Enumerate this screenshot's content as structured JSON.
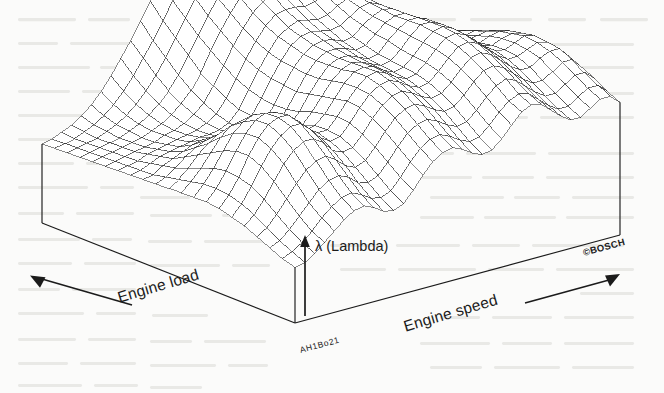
{
  "figure": {
    "kind": "3d-wireframe-surface",
    "source_mark": "©BOSCH",
    "figure_code": "AH1Bo21",
    "background_color": "#fbfbfa",
    "ink_color": "#1b1b1b",
    "mesh_color": "#2a2a2a"
  },
  "labels": {
    "vertical_axis": "λ (Lambda)",
    "left_axis": "Engine load",
    "right_axis": "Engine speed",
    "bosch": "©BOSCH",
    "code": "AH1Bo21"
  },
  "icons": {
    "up_arrow": "lambda-up-arrow-icon",
    "left_arrow": "engine-load-left-arrow-icon",
    "right_arrow": "engine-speed-right-arrow-icon"
  },
  "chart_data": {
    "type": "surface",
    "title": "",
    "xlabel": "Engine speed",
    "ylabel": "Engine load",
    "zlabel": "λ (Lambda)",
    "grid": false,
    "legend": "none",
    "axis_direction": {
      "engine_speed": "increasing to the right",
      "engine_load": "increasing to the left",
      "lambda": "increasing upward"
    },
    "nx": 34,
    "ny": 22,
    "zlim": [
      0,
      1
    ],
    "z": [
      [
        0.26,
        0.27,
        0.3,
        0.34,
        0.38,
        0.42,
        0.45,
        0.46,
        0.44,
        0.41,
        0.4,
        0.42,
        0.47,
        0.53,
        0.58,
        0.61,
        0.62,
        0.6,
        0.57,
        0.55,
        0.56,
        0.6,
        0.65,
        0.7,
        0.72,
        0.71,
        0.67,
        0.63,
        0.6,
        0.6,
        0.63,
        0.66,
        0.66,
        0.62
      ],
      [
        0.27,
        0.29,
        0.32,
        0.36,
        0.41,
        0.45,
        0.48,
        0.49,
        0.47,
        0.44,
        0.43,
        0.45,
        0.5,
        0.56,
        0.61,
        0.64,
        0.65,
        0.63,
        0.6,
        0.58,
        0.59,
        0.63,
        0.68,
        0.72,
        0.74,
        0.73,
        0.69,
        0.65,
        0.62,
        0.62,
        0.65,
        0.68,
        0.68,
        0.64
      ],
      [
        0.29,
        0.31,
        0.35,
        0.4,
        0.45,
        0.5,
        0.53,
        0.54,
        0.52,
        0.48,
        0.47,
        0.49,
        0.54,
        0.6,
        0.65,
        0.68,
        0.69,
        0.67,
        0.64,
        0.62,
        0.63,
        0.67,
        0.72,
        0.76,
        0.78,
        0.76,
        0.72,
        0.68,
        0.65,
        0.65,
        0.68,
        0.71,
        0.71,
        0.67
      ],
      [
        0.31,
        0.34,
        0.39,
        0.45,
        0.51,
        0.56,
        0.59,
        0.6,
        0.57,
        0.53,
        0.51,
        0.53,
        0.58,
        0.64,
        0.69,
        0.72,
        0.73,
        0.71,
        0.68,
        0.66,
        0.67,
        0.71,
        0.76,
        0.8,
        0.81,
        0.79,
        0.75,
        0.71,
        0.68,
        0.68,
        0.71,
        0.74,
        0.74,
        0.69
      ],
      [
        0.33,
        0.37,
        0.43,
        0.5,
        0.57,
        0.62,
        0.65,
        0.65,
        0.62,
        0.57,
        0.55,
        0.56,
        0.61,
        0.67,
        0.72,
        0.75,
        0.76,
        0.74,
        0.71,
        0.69,
        0.7,
        0.74,
        0.79,
        0.83,
        0.84,
        0.82,
        0.78,
        0.74,
        0.71,
        0.71,
        0.74,
        0.76,
        0.76,
        0.71
      ],
      [
        0.34,
        0.39,
        0.46,
        0.54,
        0.61,
        0.66,
        0.69,
        0.69,
        0.65,
        0.6,
        0.57,
        0.58,
        0.63,
        0.69,
        0.74,
        0.77,
        0.78,
        0.76,
        0.73,
        0.71,
        0.72,
        0.76,
        0.81,
        0.85,
        0.86,
        0.84,
        0.8,
        0.76,
        0.73,
        0.73,
        0.75,
        0.77,
        0.76,
        0.71
      ],
      [
        0.35,
        0.4,
        0.47,
        0.56,
        0.63,
        0.68,
        0.7,
        0.7,
        0.66,
        0.61,
        0.58,
        0.58,
        0.63,
        0.69,
        0.74,
        0.78,
        0.79,
        0.77,
        0.74,
        0.72,
        0.73,
        0.77,
        0.82,
        0.86,
        0.87,
        0.85,
        0.81,
        0.77,
        0.74,
        0.73,
        0.75,
        0.77,
        0.76,
        0.7
      ],
      [
        0.35,
        0.4,
        0.47,
        0.55,
        0.62,
        0.67,
        0.69,
        0.68,
        0.64,
        0.59,
        0.56,
        0.57,
        0.61,
        0.67,
        0.73,
        0.77,
        0.78,
        0.77,
        0.74,
        0.72,
        0.73,
        0.77,
        0.82,
        0.86,
        0.87,
        0.85,
        0.81,
        0.77,
        0.73,
        0.72,
        0.74,
        0.75,
        0.74,
        0.68
      ],
      [
        0.34,
        0.39,
        0.45,
        0.52,
        0.59,
        0.63,
        0.65,
        0.64,
        0.6,
        0.55,
        0.53,
        0.54,
        0.59,
        0.65,
        0.71,
        0.75,
        0.77,
        0.76,
        0.74,
        0.72,
        0.73,
        0.77,
        0.82,
        0.86,
        0.86,
        0.84,
        0.8,
        0.75,
        0.71,
        0.7,
        0.72,
        0.73,
        0.72,
        0.66
      ],
      [
        0.33,
        0.37,
        0.42,
        0.48,
        0.54,
        0.58,
        0.59,
        0.58,
        0.55,
        0.51,
        0.49,
        0.51,
        0.56,
        0.63,
        0.69,
        0.74,
        0.76,
        0.76,
        0.74,
        0.72,
        0.73,
        0.78,
        0.82,
        0.85,
        0.85,
        0.83,
        0.78,
        0.73,
        0.69,
        0.68,
        0.69,
        0.7,
        0.69,
        0.63
      ],
      [
        0.32,
        0.35,
        0.39,
        0.44,
        0.48,
        0.51,
        0.52,
        0.51,
        0.49,
        0.46,
        0.45,
        0.48,
        0.54,
        0.61,
        0.68,
        0.73,
        0.76,
        0.76,
        0.75,
        0.73,
        0.74,
        0.78,
        0.82,
        0.84,
        0.84,
        0.81,
        0.76,
        0.71,
        0.67,
        0.65,
        0.66,
        0.67,
        0.66,
        0.6
      ],
      [
        0.31,
        0.33,
        0.36,
        0.4,
        0.43,
        0.45,
        0.46,
        0.45,
        0.44,
        0.42,
        0.43,
        0.46,
        0.53,
        0.61,
        0.68,
        0.73,
        0.76,
        0.77,
        0.76,
        0.74,
        0.75,
        0.79,
        0.82,
        0.84,
        0.83,
        0.79,
        0.74,
        0.69,
        0.64,
        0.62,
        0.63,
        0.64,
        0.63,
        0.57
      ],
      [
        0.3,
        0.31,
        0.34,
        0.36,
        0.38,
        0.4,
        0.41,
        0.41,
        0.4,
        0.4,
        0.41,
        0.46,
        0.53,
        0.61,
        0.68,
        0.74,
        0.77,
        0.78,
        0.77,
        0.76,
        0.77,
        0.8,
        0.83,
        0.84,
        0.82,
        0.78,
        0.72,
        0.66,
        0.62,
        0.6,
        0.6,
        0.61,
        0.6,
        0.54
      ],
      [
        0.29,
        0.3,
        0.32,
        0.34,
        0.35,
        0.36,
        0.37,
        0.38,
        0.38,
        0.39,
        0.41,
        0.46,
        0.54,
        0.62,
        0.69,
        0.75,
        0.78,
        0.8,
        0.79,
        0.78,
        0.79,
        0.82,
        0.84,
        0.84,
        0.82,
        0.77,
        0.71,
        0.65,
        0.6,
        0.58,
        0.58,
        0.58,
        0.57,
        0.51
      ],
      [
        0.28,
        0.29,
        0.3,
        0.32,
        0.33,
        0.34,
        0.35,
        0.36,
        0.37,
        0.39,
        0.42,
        0.48,
        0.56,
        0.64,
        0.71,
        0.77,
        0.81,
        0.82,
        0.82,
        0.81,
        0.82,
        0.84,
        0.85,
        0.85,
        0.82,
        0.77,
        0.7,
        0.64,
        0.59,
        0.56,
        0.55,
        0.55,
        0.54,
        0.48
      ],
      [
        0.27,
        0.28,
        0.29,
        0.3,
        0.31,
        0.32,
        0.34,
        0.35,
        0.37,
        0.4,
        0.44,
        0.51,
        0.59,
        0.67,
        0.74,
        0.8,
        0.84,
        0.86,
        0.85,
        0.84,
        0.85,
        0.86,
        0.87,
        0.86,
        0.83,
        0.77,
        0.7,
        0.63,
        0.57,
        0.54,
        0.53,
        0.52,
        0.51,
        0.45
      ],
      [
        0.26,
        0.27,
        0.28,
        0.29,
        0.3,
        0.31,
        0.33,
        0.35,
        0.38,
        0.42,
        0.47,
        0.54,
        0.63,
        0.71,
        0.78,
        0.84,
        0.88,
        0.89,
        0.88,
        0.87,
        0.87,
        0.88,
        0.88,
        0.87,
        0.83,
        0.77,
        0.69,
        0.62,
        0.56,
        0.52,
        0.5,
        0.49,
        0.48,
        0.42
      ],
      [
        0.25,
        0.26,
        0.27,
        0.28,
        0.29,
        0.31,
        0.33,
        0.36,
        0.4,
        0.45,
        0.51,
        0.59,
        0.67,
        0.75,
        0.82,
        0.88,
        0.91,
        0.92,
        0.91,
        0.89,
        0.89,
        0.89,
        0.89,
        0.87,
        0.83,
        0.76,
        0.68,
        0.6,
        0.54,
        0.5,
        0.48,
        0.46,
        0.45,
        0.39
      ],
      [
        0.24,
        0.25,
        0.26,
        0.27,
        0.29,
        0.31,
        0.34,
        0.38,
        0.43,
        0.49,
        0.56,
        0.64,
        0.72,
        0.8,
        0.86,
        0.91,
        0.94,
        0.94,
        0.93,
        0.91,
        0.9,
        0.9,
        0.89,
        0.87,
        0.82,
        0.75,
        0.66,
        0.58,
        0.52,
        0.48,
        0.45,
        0.44,
        0.42,
        0.36
      ],
      [
        0.23,
        0.24,
        0.25,
        0.27,
        0.29,
        0.32,
        0.36,
        0.41,
        0.47,
        0.54,
        0.61,
        0.69,
        0.77,
        0.84,
        0.9,
        0.94,
        0.96,
        0.96,
        0.95,
        0.92,
        0.91,
        0.9,
        0.89,
        0.86,
        0.81,
        0.73,
        0.64,
        0.56,
        0.5,
        0.46,
        0.43,
        0.41,
        0.39,
        0.33
      ],
      [
        0.22,
        0.23,
        0.25,
        0.27,
        0.3,
        0.34,
        0.39,
        0.45,
        0.52,
        0.59,
        0.67,
        0.75,
        0.82,
        0.88,
        0.93,
        0.96,
        0.98,
        0.98,
        0.96,
        0.93,
        0.91,
        0.9,
        0.88,
        0.85,
        0.79,
        0.71,
        0.62,
        0.54,
        0.48,
        0.44,
        0.41,
        0.39,
        0.37,
        0.31
      ]
    ]
  }
}
